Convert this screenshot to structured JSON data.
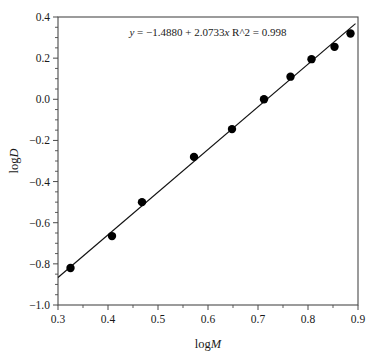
{
  "chart_data": {
    "type": "scatter",
    "title": "",
    "subtitle": "",
    "xlabel_prefix": "log",
    "xlabel_var": "M",
    "ylabel_prefix": "log",
    "ylabel_var": "D",
    "xlim": [
      0.3,
      0.9
    ],
    "ylim": [
      -1.0,
      0.4
    ],
    "xticks": [
      0.3,
      0.4,
      0.5,
      0.6,
      0.7,
      0.8,
      0.9
    ],
    "xtick_labels": [
      "0.3",
      "0.4",
      "0.5",
      "0.6",
      "0.7",
      "0.8",
      "0.9"
    ],
    "yticks": [
      0.4,
      0.2,
      0.0,
      -0.2,
      -0.4,
      -0.6,
      -0.8,
      -1.0
    ],
    "ytick_labels": [
      "0.4",
      "0.2",
      "0.0",
      "−0.2",
      "−0.4",
      "−0.6",
      "−0.8",
      "−1.0"
    ],
    "x_minor_step": 0.05,
    "y_minor_step": 0.05,
    "grid": false,
    "legend": null,
    "marker": "filled-circle",
    "marker_color": "#000000",
    "line_color": "#111111",
    "frame": "box",
    "x": [
      0.325,
      0.408,
      0.468,
      0.572,
      0.648,
      0.712,
      0.765,
      0.807,
      0.853,
      0.885
    ],
    "y": [
      -0.82,
      -0.665,
      -0.5,
      -0.28,
      -0.145,
      0.0,
      0.11,
      0.195,
      0.255,
      0.32
    ],
    "points": [
      {
        "x": 0.325,
        "y": -0.82
      },
      {
        "x": 0.408,
        "y": -0.665
      },
      {
        "x": 0.468,
        "y": -0.5
      },
      {
        "x": 0.572,
        "y": -0.28
      },
      {
        "x": 0.648,
        "y": -0.145
      },
      {
        "x": 0.712,
        "y": 0.0
      },
      {
        "x": 0.765,
        "y": 0.11
      },
      {
        "x": 0.807,
        "y": 0.195
      },
      {
        "x": 0.853,
        "y": 0.255
      },
      {
        "x": 0.885,
        "y": 0.32
      }
    ],
    "fit": {
      "intercept": -1.488,
      "slope": 2.0733,
      "r_squared": 0.998,
      "x_start": 0.3,
      "x_end": 0.895
    },
    "annotations": [
      {
        "name": "regression-equation",
        "y_var": "y",
        "eq_sign": "=",
        "intercept_text": "−1.4880",
        "plus": "+",
        "slope_text": "2.0733",
        "x_var": "x",
        "r2_label": "R^2",
        "r2_sign": "=",
        "r2_value": "0.998",
        "full_text": "y = −1.4880 + 2.0733x  R^2 = 0.998"
      }
    ]
  }
}
